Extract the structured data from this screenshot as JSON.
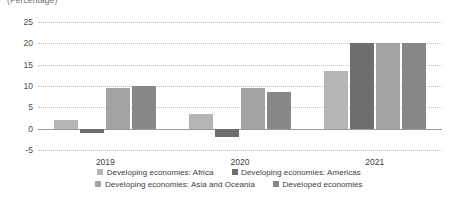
{
  "caption": {
    "unit_note": "(Percentage)"
  },
  "chart_data": {
    "type": "bar",
    "title": "",
    "subtitle": "",
    "xlabel": "",
    "ylabel": "",
    "unit_note": "(Percentage)",
    "categories": [
      "2019",
      "2020",
      "2021"
    ],
    "series": [
      {
        "name": "Developing economies: Africa",
        "color": "#b5b5b5",
        "values": [
          2.0,
          3.5,
          13.5
        ]
      },
      {
        "name": "Developing economies: Americas",
        "color": "#6e6e6e",
        "values": [
          -1.0,
          -2.0,
          20.0
        ]
      },
      {
        "name": "Developing economies: Asia and Oceania",
        "color": "#a3a3a3",
        "values": [
          9.5,
          9.5,
          20.0
        ]
      },
      {
        "name": "Developed economies",
        "color": "#878787",
        "values": [
          10.0,
          8.5,
          20.0
        ]
      }
    ],
    "ylim": [
      -5,
      25
    ],
    "yticks": [
      25,
      20,
      15,
      10,
      5,
      0,
      -5
    ],
    "ytick_labels": [
      "25",
      "20",
      "15",
      "10",
      "5",
      "0",
      "-5"
    ],
    "grid": true,
    "grid_style": "dotted-horizontal",
    "zero_line": true,
    "legend_position": "bottom",
    "legend_rows": [
      [
        "Developing economies: Africa",
        "Developing economies: Americas"
      ],
      [
        "Developing economies: Asia and Oceania",
        "Developed economies"
      ]
    ]
  },
  "colors": {
    "series_africa": "#b5b5b5",
    "series_americas": "#6e6e6e",
    "series_asia_oceania": "#a3a3a3",
    "series_developed": "#878787",
    "grid": "#c3c3c3",
    "zero_line": "#9a9a9a",
    "axis_text": "#3d3d3d",
    "background": "#ffffff"
  }
}
